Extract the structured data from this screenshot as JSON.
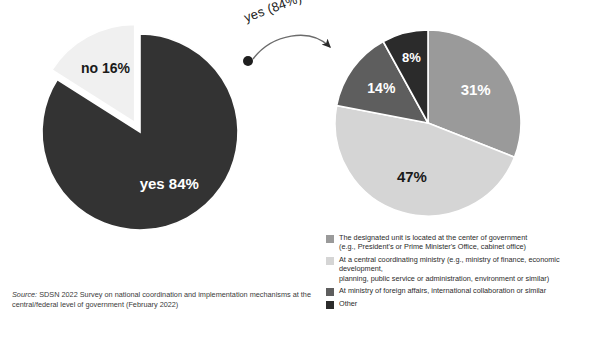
{
  "annotation": {
    "label": "yes (84%)",
    "arrow_icon": "curved-arrow-icon",
    "dot_icon": "dot-marker-icon"
  },
  "source": {
    "label": "Source:",
    "text": " SDSN 2022 Survey on national coordination and implementation mechanisms at the central/federal level of government (February 2022)"
  },
  "legend": {
    "items": [
      {
        "color": "#9a9a9a",
        "text": "The designated unit is located at the center of government\n(e.g., President's or Prime Minister's Office, cabinet office)"
      },
      {
        "color": "#d5d5d5",
        "text": "At a central coordinating ministry (e.g., ministry of finance, economic development,\nplanning, public service or administration, environment or similar)"
      },
      {
        "color": "#5e5e5e",
        "text": "At ministry of foreign affairs, international collaboration or similar"
      },
      {
        "color": "#2b2b2b",
        "text": "Other"
      }
    ]
  },
  "chart_data": [
    {
      "type": "pie",
      "id": "left-pie",
      "title": "",
      "categories": [
        "yes",
        "no"
      ],
      "values": [
        84,
        16
      ],
      "labels": [
        "yes 84%",
        "no 16%"
      ],
      "colors": [
        "#333333",
        "#f0f0f0"
      ],
      "label_colors": [
        "#ffffff",
        "#1a1a1a"
      ],
      "exploded": [
        false,
        true
      ],
      "start_angle_deg": 0,
      "direction": "clockwise",
      "center": [
        140,
        132
      ],
      "radius": 98,
      "legend": "none"
    },
    {
      "type": "pie",
      "id": "right-pie",
      "title": "",
      "categories": [
        "The designated unit is located at the center of government (e.g., President's or Prime Minister's Office, cabinet office)",
        "At a central coordinating ministry (e.g., ministry of finance, economic development, planning, public service or administration, environment or similar)",
        "At ministry of foreign affairs, international collaboration or similar",
        "Other"
      ],
      "values": [
        31,
        47,
        14,
        8
      ],
      "labels": [
        "31%",
        "47%",
        "14%",
        "8%"
      ],
      "colors": [
        "#9a9a9a",
        "#d5d5d5",
        "#5e5e5e",
        "#2b2b2b"
      ],
      "label_colors": [
        "#ffffff",
        "#1a1a1a",
        "#ffffff",
        "#ffffff"
      ],
      "exploded": [
        false,
        false,
        false,
        false
      ],
      "start_angle_deg": 0,
      "direction": "clockwise",
      "center": [
        428,
        123
      ],
      "radius": 93,
      "legend": "bottom"
    }
  ]
}
